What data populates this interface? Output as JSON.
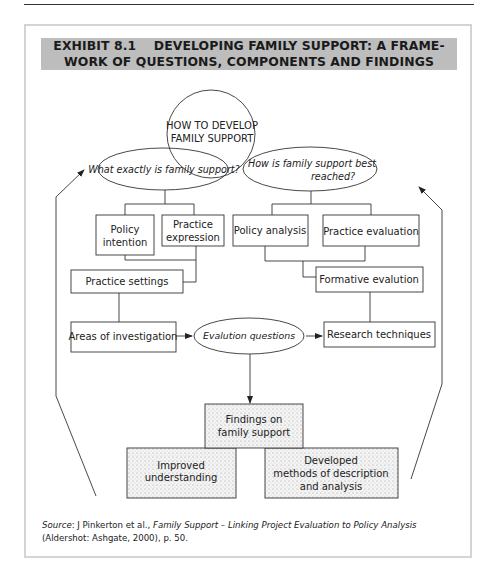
{
  "exhibit": {
    "title_line1": "EXHIBIT 8.1    DEVELOPING FAMILY SUPPORT: A FRAME-",
    "title_line2": "WORK OF QUESTIONS, COMPONENTS AND FINDINGS"
  },
  "diagram": {
    "center_circle": {
      "line1": "HOW TO DEVELOP",
      "line2": "FAMILY SUPPORT"
    },
    "left_question": "What exactly is family support?",
    "right_question": {
      "line1": "How is family support best",
      "line2": "reached?"
    },
    "boxes": {
      "policy_intention": {
        "line1": "Policy",
        "line2": "intention"
      },
      "practice_expression": {
        "line1": "Practice",
        "line2": "expression"
      },
      "policy_analysis": "Policy analysis",
      "practice_evaluation": "Practice evaluation",
      "practice_settings": "Practice settings",
      "formative_evalution": "Formative evalution",
      "areas_of_investigation": "Areas of investigation",
      "evalution_questions": "Evalution questions",
      "research_techniques": "Research techniques",
      "findings": {
        "line1": "Findings on",
        "line2": "family support"
      },
      "improved_understanding": {
        "line1": "Improved",
        "line2": "understanding"
      },
      "developed_methods": {
        "line1": "Developed",
        "line2": "methods of description",
        "line3": "and analysis"
      }
    }
  },
  "source": {
    "label": "Source",
    "author": ": J Pinkerton et al., ",
    "title": "Family Support – Linking Project Evaluation to Policy Analysis",
    "publication": " (Aldershot: Ashgate, 2000), p. 50."
  }
}
